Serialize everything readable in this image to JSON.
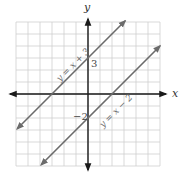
{
  "chart_data": {
    "type": "line",
    "title": "",
    "xlabel": "x",
    "ylabel": "y",
    "xlim": [
      -6,
      6
    ],
    "ylim": [
      -6,
      6
    ],
    "grid": true,
    "grid_step": 1,
    "legend": null,
    "series": [
      {
        "name": "y = x + 3",
        "label": "y = x + 3",
        "slope": 1,
        "intercept": 3,
        "x": [
          -5.9,
          3.1
        ],
        "y": [
          -2.9,
          6.1
        ],
        "color": "#6b6b6b"
      },
      {
        "name": "y = x − 2",
        "label": "y = x − 2",
        "slope": 1,
        "intercept": -2,
        "x": [
          -3.9,
          6.0
        ],
        "y": [
          -5.9,
          4.0
        ],
        "color": "#6b6b6b"
      }
    ],
    "annotations": [
      {
        "text": "3",
        "x": 0,
        "y": 3
      },
      {
        "text": "−2",
        "x": 0,
        "y": -2
      }
    ]
  },
  "labels": {
    "x_axis": "x",
    "y_axis": "y",
    "intercept_upper": "3",
    "intercept_lower": "−2",
    "line1": "y = x + 3",
    "line2": "y = x − 2"
  },
  "colors": {
    "grid": "#cfcfcf",
    "axis": "#1a1a1a",
    "line": "#6b6b6b"
  }
}
